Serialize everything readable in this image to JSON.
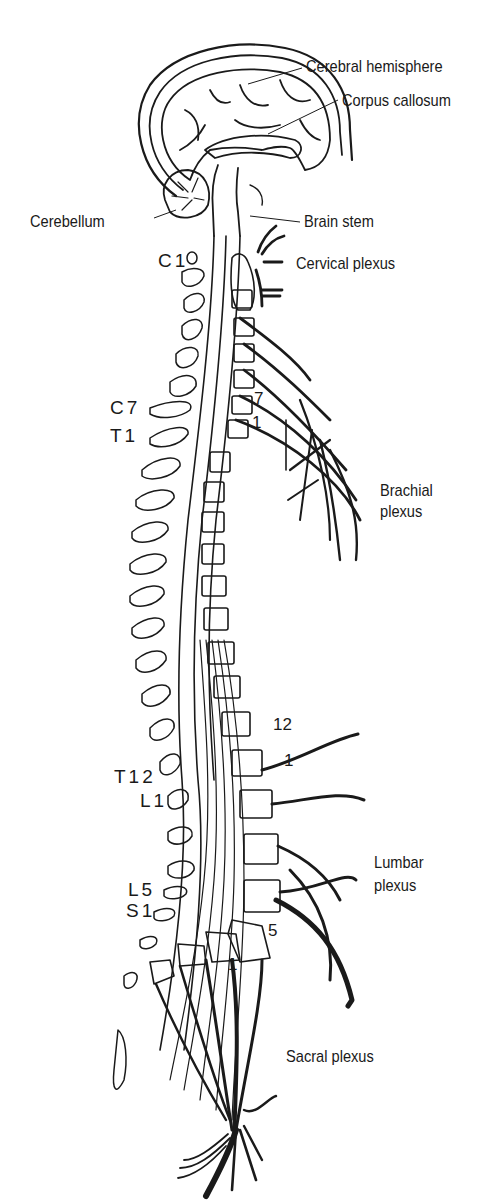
{
  "colors": {
    "ink": "#1a1a1a",
    "background": "#ffffff"
  },
  "labels": {
    "cerebral_hemisphere": "Cerebral hemisphere",
    "corpus_callosum": "Corpus callosum",
    "cerebellum": "Cerebellum",
    "brain_stem": "Brain stem",
    "cervical_plexus": "Cervical plexus",
    "brachial_plexus": [
      "Brachial",
      "plexus"
    ],
    "lumbar_plexus": [
      "Lumbar",
      "plexus"
    ],
    "sacral_plexus": "Sacral plexus"
  },
  "vertebra_levels": {
    "left": [
      {
        "id": "c1",
        "text": "C1"
      },
      {
        "id": "c7",
        "text": "C7"
      },
      {
        "id": "t1",
        "text": "T1"
      },
      {
        "id": "t12",
        "text": "T12"
      },
      {
        "id": "l1",
        "text": "L1"
      },
      {
        "id": "l5",
        "text": "L5"
      },
      {
        "id": "s1",
        "text": "S1"
      }
    ],
    "right_numbers": [
      {
        "id": "cervical-7",
        "text": "7"
      },
      {
        "id": "thoracic-1",
        "text": "1"
      },
      {
        "id": "thoracic-12",
        "text": "12"
      },
      {
        "id": "lumbar-1",
        "text": "1"
      },
      {
        "id": "lumbar-5",
        "text": "5"
      },
      {
        "id": "sacral-1",
        "text": "1"
      }
    ]
  }
}
